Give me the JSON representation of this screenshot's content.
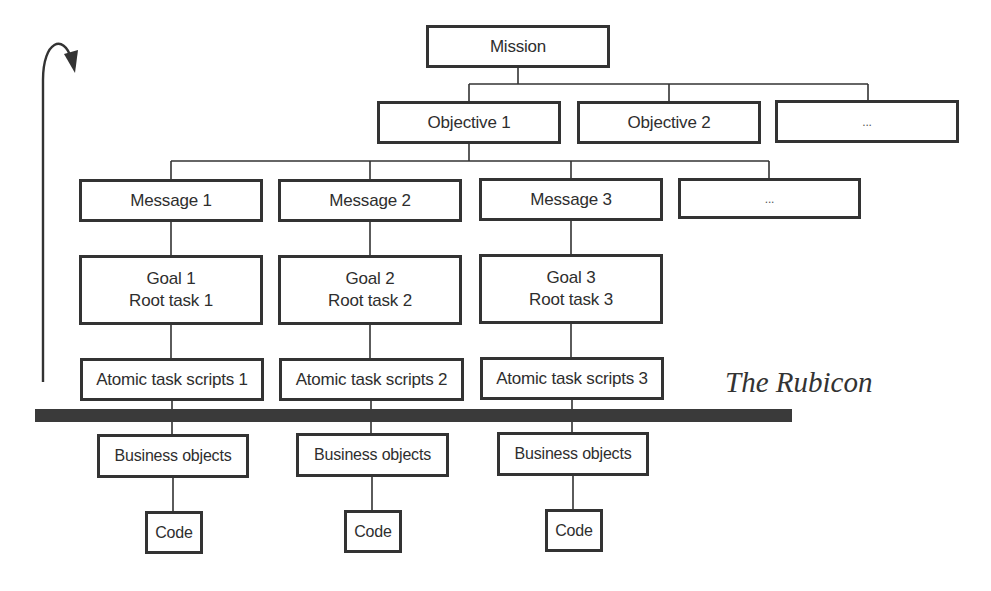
{
  "diagram": {
    "mission": {
      "label": "Mission"
    },
    "objectives": [
      {
        "label": "Objective 1"
      },
      {
        "label": "Objective 2"
      },
      {
        "label": "..."
      }
    ],
    "messages": [
      {
        "label": "Message 1"
      },
      {
        "label": "Message 2"
      },
      {
        "label": "Message 3"
      },
      {
        "label": "..."
      }
    ],
    "goals": [
      {
        "line1": "Goal 1",
        "line2": "Root task 1"
      },
      {
        "line1": "Goal 2",
        "line2": "Root task 2"
      },
      {
        "line1": "Goal 3",
        "line2": "Root task 3"
      }
    ],
    "atomic_scripts": [
      {
        "label": "Atomic task scripts 1"
      },
      {
        "label": "Atomic task scripts 2"
      },
      {
        "label": "Atomic task scripts 3"
      }
    ],
    "business_objects": [
      {
        "label": "Business objects"
      },
      {
        "label": "Business objects"
      },
      {
        "label": "Business objects"
      }
    ],
    "code": [
      {
        "label": "Code"
      },
      {
        "label": "Code"
      },
      {
        "label": "Code"
      }
    ],
    "rubicon": {
      "label": "The Rubicon"
    },
    "colors": {
      "line": "#333333",
      "bar": "#3a3a3a",
      "background": "#ffffff"
    }
  }
}
